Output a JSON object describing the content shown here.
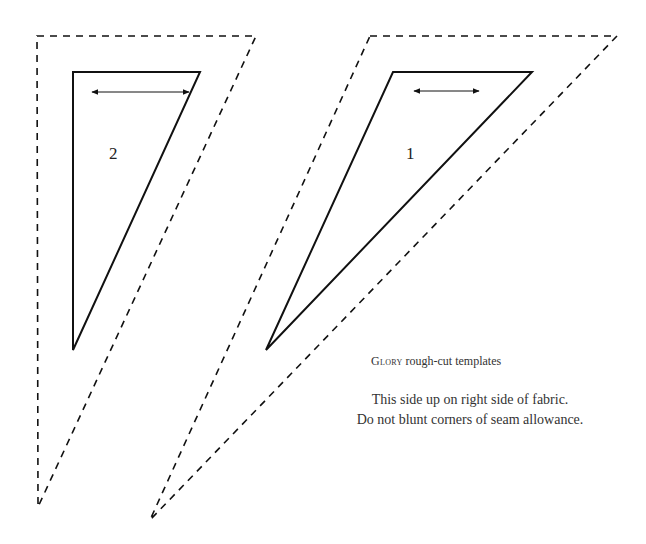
{
  "templates": [
    {
      "id": "template-2",
      "label": "2",
      "seam_allowance_polygon": [
        [
          37,
          36
        ],
        [
          256,
          36
        ],
        [
          38,
          507
        ]
      ],
      "cut_line_polygon": [
        [
          73,
          72
        ],
        [
          200,
          72
        ],
        [
          73,
          350
        ]
      ],
      "grain_arrow": {
        "x1": 92,
        "x2": 189,
        "y": 92
      },
      "label_position": {
        "x": 109,
        "y": 144
      }
    },
    {
      "id": "template-1",
      "label": "1",
      "seam_allowance_polygon": [
        [
          370,
          36
        ],
        [
          617,
          36
        ],
        [
          150,
          520
        ]
      ],
      "cut_line_polygon": [
        [
          393,
          72
        ],
        [
          532,
          72
        ],
        [
          266,
          350
        ]
      ],
      "grain_arrow": {
        "x1": 414,
        "x2": 479,
        "y": 91
      },
      "label_position": {
        "x": 406,
        "y": 144
      }
    }
  ],
  "caption": {
    "smallcaps_word": "Glory",
    "rest": " rough-cut templates"
  },
  "instructions": [
    "This side up on right side of fabric.",
    "Do not blunt corners of seam allowance."
  ],
  "colors": {
    "line": "#111111",
    "background": "#ffffff"
  }
}
